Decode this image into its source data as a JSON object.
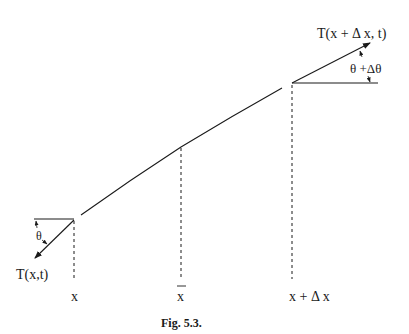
{
  "figure": {
    "caption": "Fig. 5.3.",
    "labels": {
      "left_tension": "T(x,t)",
      "right_tension": "T(x + Δ x, t)",
      "left_angle": "θ",
      "right_angle": "θ +Δθ",
      "x_left": "x",
      "x_mid": "x",
      "x_right": "x + Δ x"
    },
    "colors": {
      "ink": "#1a1a1a",
      "background": "#ffffff"
    }
  }
}
